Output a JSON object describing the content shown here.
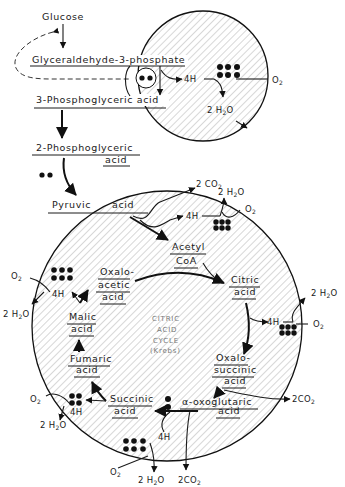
{
  "diagram": {
    "glycolysis": {
      "glucose": "Glucose",
      "g3p": "Glyceraldehyde-3-phosphate",
      "pga3": "3-Phosphoglyceric acid",
      "pga2_line1": "2-Phosphoglyceric",
      "pga2_line2": "acid",
      "pyruvic": "Pyruvic",
      "pyruvic_acid": "acid"
    },
    "top_circle": {
      "h4": "4H",
      "o2": "O",
      "o2_sub": "2",
      "h2o": "2 H",
      "h2o_sub": "2",
      "h2o_end": "O"
    },
    "pyruvate_step": {
      "co2": "2 CO",
      "co2_sub": "2",
      "h2o": "2 H",
      "h2o_sub": "2",
      "h2o_end": "O",
      "h4": "4H",
      "o2": "O",
      "o2_sub": "2"
    },
    "cycle": {
      "title_line1": "CITRIC",
      "title_line2": "ACID",
      "title_line3": "CYCLE",
      "title_line4": "(Krebs)",
      "acetyl_line1": "Acetyl",
      "acetyl_line2": "CoA",
      "citric_line1": "Citric",
      "citric_line2": "acid",
      "oxalosuccinic_line1": "Oxalo-",
      "oxalosuccinic_line2": "succinic",
      "oxalosuccinic_line3": "acid",
      "oxoglutaric_line1": "α-oxoglutaric",
      "oxoglutaric_line2": "acid",
      "succinic_line1": "Succinic",
      "succinic_line2": "acid",
      "fumaric_line1": "Fumaric",
      "fumaric_line2": "acid",
      "malic_line1": "Malic",
      "malic_line2": "acid",
      "oxaloacetic_line1": "Oxalo-",
      "oxaloacetic_line2": "acetic",
      "oxaloacetic_line3": "acid"
    },
    "side_products": {
      "h4": "4H",
      "o2": "O",
      "o2_sub": "2",
      "h2o": "2 H",
      "h2o_sub": "2",
      "h2o_end": "O",
      "co2": "2CO",
      "co2_sub": "2"
    }
  }
}
